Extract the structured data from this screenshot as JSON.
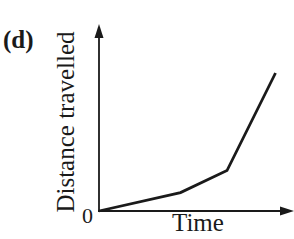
{
  "panel_label": "(d)",
  "top_partial": {
    "time_label": "Time",
    "g_fragment": "g"
  },
  "chart_data": {
    "type": "line",
    "title": "",
    "xlabel": "Time",
    "ylabel": "Distance travelled",
    "origin_label": "0",
    "grid": false,
    "legend": null,
    "x": [
      0,
      0.42,
      0.66,
      0.91
    ],
    "values": [
      0,
      0.1,
      0.22,
      0.75
    ],
    "xlim": [
      0,
      1
    ],
    "ylim": [
      0,
      1
    ]
  },
  "colors": {
    "line": "#1a1a1a",
    "axis": "#1a1a1a",
    "background": "#ffffff"
  }
}
